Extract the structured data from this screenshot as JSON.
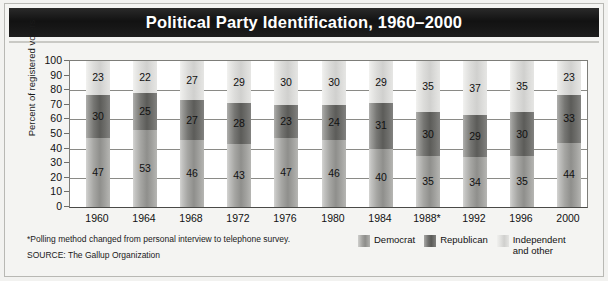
{
  "title": "Political Party Identification, 1960–2000",
  "footnote": "*Polling method changed from personal interview to telephone survey.",
  "source": "SOURCE: The Gallup Organization",
  "legend": {
    "items": [
      {
        "label": "Democrat",
        "color": "#8f8f8c"
      },
      {
        "label": "Republican",
        "color": "#5c5c59"
      },
      {
        "label": "Independent and other",
        "color": "#d0d0ce"
      }
    ]
  },
  "chart_data": {
    "type": "bar",
    "stacked": true,
    "title": "Political Party Identification, 1960–2000",
    "xlabel": "",
    "ylabel": "Percent of registered voters",
    "ylim": [
      0,
      100
    ],
    "ytick_step": 10,
    "grid": true,
    "gridline_values": [
      100,
      80,
      60,
      40,
      20,
      0
    ],
    "legend_position": "bottom-right",
    "categories": [
      "1960",
      "1964",
      "1968",
      "1972",
      "1976",
      "1980",
      "1984",
      "1988*",
      "1992",
      "1996",
      "2000"
    ],
    "ytick_labels": [
      "100",
      "90",
      "80",
      "70",
      "60",
      "50",
      "40",
      "30",
      "20",
      "10",
      "0"
    ],
    "series": [
      {
        "name": "Democrat",
        "color": "#8f8f8c",
        "values": [
          47,
          53,
          46,
          43,
          47,
          46,
          40,
          35,
          34,
          35,
          44
        ]
      },
      {
        "name": "Republican",
        "color": "#5c5c59",
        "values": [
          30,
          25,
          27,
          28,
          23,
          24,
          31,
          30,
          29,
          30,
          33
        ]
      },
      {
        "name": "Independent and other",
        "color": "#d0d0ce",
        "values": [
          23,
          22,
          27,
          29,
          30,
          30,
          29,
          35,
          37,
          35,
          23
        ]
      }
    ]
  }
}
